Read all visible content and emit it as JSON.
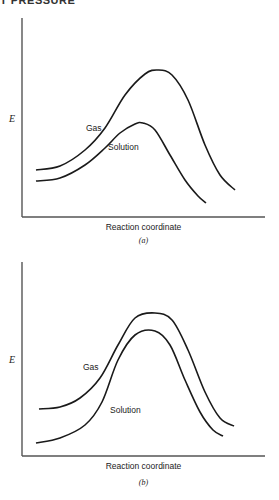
{
  "header": {
    "text": "T PRESSURE"
  },
  "chart_data": [
    {
      "type": "line",
      "panel": "(a)",
      "title": "",
      "xlabel": "Reaction coordinate",
      "ylabel": "E",
      "grid": false,
      "legend": "inline labels",
      "axes": {
        "origin": [
          22,
          217
        ],
        "x_end": 265,
        "y_top": 18
      },
      "series": [
        {
          "name": "Gas",
          "label_pos": [
            86,
            131
          ],
          "points": [
            [
              36,
              170
            ],
            [
              60,
              166
            ],
            [
              85,
              150
            ],
            [
              105,
              128
            ],
            [
              125,
              95
            ],
            [
              145,
              74
            ],
            [
              158,
              70
            ],
            [
              172,
              75
            ],
            [
              188,
              100
            ],
            [
              205,
              145
            ],
            [
              220,
              175
            ],
            [
              235,
              190
            ]
          ]
        },
        {
          "name": "Solution",
          "label_pos": [
            108,
            150
          ],
          "points": [
            [
              36,
              181
            ],
            [
              60,
              178
            ],
            [
              85,
              165
            ],
            [
              105,
              148
            ],
            [
              120,
              133
            ],
            [
              135,
              124
            ],
            [
              143,
              123
            ],
            [
              155,
              130
            ],
            [
              170,
              155
            ],
            [
              185,
              180
            ],
            [
              198,
              196
            ],
            [
              206,
              203
            ]
          ]
        }
      ]
    },
    {
      "type": "line",
      "panel": "(b)",
      "title": "",
      "xlabel": "Reaction coordinate",
      "ylabel": "E",
      "grid": false,
      "legend": "inline labels",
      "axes": {
        "origin": [
          22,
          456
        ],
        "x_end": 265,
        "y_top": 262
      },
      "series": [
        {
          "name": "Gas",
          "label_pos": [
            83,
            370
          ],
          "points": [
            [
              39,
              409
            ],
            [
              60,
              407
            ],
            [
              80,
              398
            ],
            [
              100,
              378
            ],
            [
              118,
              345
            ],
            [
              135,
              318
            ],
            [
              155,
              313
            ],
            [
              172,
              320
            ],
            [
              188,
              350
            ],
            [
              205,
              392
            ],
            [
              220,
              418
            ],
            [
              234,
              426
            ]
          ]
        },
        {
          "name": "Solution",
          "label_pos": [
            110,
            413
          ],
          "points": [
            [
              36,
              443
            ],
            [
              60,
              438
            ],
            [
              85,
              425
            ],
            [
              102,
              402
            ],
            [
              118,
              360
            ],
            [
              135,
              335
            ],
            [
              155,
              331
            ],
            [
              170,
              345
            ],
            [
              185,
              380
            ],
            [
              200,
              412
            ],
            [
              213,
              430
            ],
            [
              223,
              436
            ]
          ]
        }
      ]
    }
  ]
}
